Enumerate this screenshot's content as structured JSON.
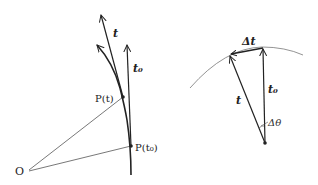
{
  "figure": {
    "left_panel": {
      "origin_label": "O",
      "point_t_label": "P(t)",
      "point_t0_label": "P(t₀)",
      "vector_t_label": "t",
      "vector_t0_label": "t₀"
    },
    "right_panel": {
      "delta_t_label": "Δt",
      "vector_t_label": "t",
      "vector_t0_label": "t₀",
      "angle_label": "Δθ"
    },
    "colors": {
      "stroke": "#222222",
      "thin_stroke": "#555555",
      "arc": "#777777",
      "background": "#ffffff"
    }
  }
}
